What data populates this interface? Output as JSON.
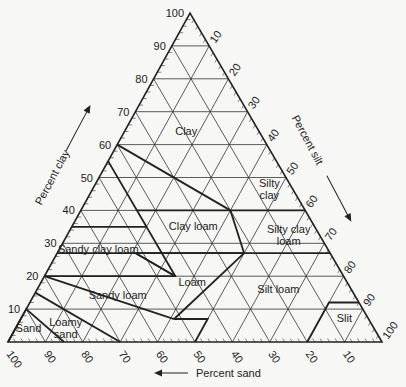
{
  "figure": {
    "axes": {
      "clay": {
        "label": "Percent clay",
        "ticks": [
          "10",
          "20",
          "30",
          "40",
          "50",
          "60",
          "70",
          "80",
          "90",
          "100"
        ]
      },
      "silt": {
        "label": "Percent silt",
        "ticks": [
          "10",
          "20",
          "30",
          "40",
          "50",
          "60",
          "70",
          "80",
          "90",
          "100"
        ]
      },
      "sand": {
        "label": "Percent sand",
        "ticks": [
          "100",
          "90",
          "80",
          "70",
          "60",
          "50",
          "40",
          "30",
          "20",
          "10"
        ]
      }
    },
    "classes": [
      {
        "name": "Clay",
        "lines": [
          "Clay"
        ],
        "clay": 63,
        "sand": 20
      },
      {
        "name": "Silty clay",
        "lines": [
          "Silty",
          "clay"
        ],
        "clay": 47,
        "sand": 6
      },
      {
        "name": "Sandy clay",
        "lines": [],
        "clay": 0,
        "sand": 0
      },
      {
        "name": "Clay loam",
        "lines": [
          "Clay loam"
        ],
        "clay": 34,
        "sand": 33
      },
      {
        "name": "Silty clay loam",
        "lines": [
          "Silty clay",
          "loam"
        ],
        "clay": 33,
        "sand": 8
      },
      {
        "name": "Sandy clay loam",
        "lines": [
          "Sandy clay loam"
        ],
        "clay": 27,
        "sand": 62
      },
      {
        "name": "Loam",
        "lines": [
          "Loam"
        ],
        "clay": 17,
        "sand": 42
      },
      {
        "name": "Silt loam",
        "lines": [
          "Silt loam"
        ],
        "clay": 15,
        "sand": 20
      },
      {
        "name": "Sandy loam",
        "lines": [
          "Sandy loam"
        ],
        "clay": 13,
        "sand": 64
      },
      {
        "name": "Slit",
        "lines": [
          "Slit"
        ],
        "clay": 6,
        "sand": 7
      },
      {
        "name": "Loamy sand",
        "lines": [
          "Loamy",
          "sand"
        ],
        "clay": 5,
        "sand": 82
      },
      {
        "name": "Sand",
        "lines": [
          "Sand"
        ],
        "clay": 3,
        "sand": 93
      }
    ]
  },
  "chart_data": {
    "type": "ternary",
    "axes": [
      "Percent clay",
      "Percent silt",
      "Percent sand"
    ],
    "tick_step": 10,
    "classes": [
      "Clay",
      "Silty clay",
      "Clay loam",
      "Silty clay loam",
      "Sandy clay loam",
      "Loam",
      "Silt loam",
      "Sandy loam",
      "Slit",
      "Loamy sand",
      "Sand"
    ],
    "boundaries_clay_sand": [
      [
        [
          0,
          100
        ],
        [
          10,
          90
        ],
        [
          0,
          85
        ]
      ],
      [
        [
          15,
          85
        ],
        [
          0,
          70
        ]
      ],
      [
        [
          20,
          80
        ],
        [
          7,
          52
        ],
        [
          7,
          43
        ],
        [
          0,
          50
        ]
      ],
      [
        [
          0,
          20
        ],
        [
          12,
          8
        ],
        [
          12,
          0
        ]
      ],
      [
        [
          20,
          80
        ],
        [
          20,
          45
        ],
        [
          35,
          45
        ],
        [
          35,
          65
        ]
      ],
      [
        [
          27,
          73
        ],
        [
          27,
          23
        ],
        [
          40,
          20
        ],
        [
          40,
          45
        ],
        [
          55,
          45
        ],
        [
          35,
          45
        ]
      ],
      [
        [
          27,
          23
        ],
        [
          27,
          52
        ],
        [
          20,
          45
        ]
      ],
      [
        [
          27,
          0
        ],
        [
          27,
          23
        ]
      ],
      [
        [
          40,
          0
        ],
        [
          40,
          20
        ]
      ],
      [
        [
          40,
          20
        ],
        [
          60,
          40
        ]
      ],
      [
        [
          7,
          52
        ],
        [
          27,
          23
        ]
      ],
      [
        [
          27,
          52
        ],
        [
          20,
          45
        ]
      ]
    ]
  }
}
